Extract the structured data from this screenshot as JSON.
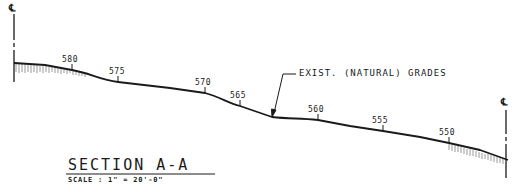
{
  "drawing": {
    "title": "SECTION  A-A",
    "scale": "SCALE : 1\" = 20'-0\"",
    "annotation": "EXIST. (NATURAL) GRADES",
    "centerline_symbol": "℄",
    "line_color": "#1a1a1a",
    "contours": [
      {
        "elevation": "580",
        "x": 72,
        "y": 70
      },
      {
        "elevation": "575",
        "x": 118,
        "y": 82
      },
      {
        "elevation": "570",
        "x": 205,
        "y": 93
      },
      {
        "elevation": "565",
        "x": 240,
        "y": 106
      },
      {
        "elevation": "560",
        "x": 318,
        "y": 120
      },
      {
        "elevation": "555",
        "x": 383,
        "y": 131
      },
      {
        "elevation": "550",
        "x": 449,
        "y": 143
      }
    ]
  }
}
